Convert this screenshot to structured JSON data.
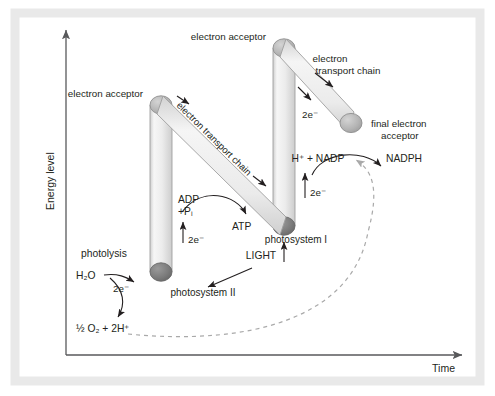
{
  "figure": {
    "axes": {
      "y_label": "Energy level",
      "x_label": "Time"
    },
    "colors": {
      "background": "#ffffff",
      "frame": "#e8e8e8",
      "axis": "#58595b",
      "text": "#231f20",
      "column_fill_light": "#f2f2f2",
      "column_fill_mid": "#dcdcdc",
      "acceptor_circle": "#b3b3b3",
      "photosystem_circle": "#7a7a7a",
      "final_acceptor_circle": "#a6a6a6",
      "dashed_curve": "#a9a9a9"
    },
    "labels": {
      "electron_acceptor_ps2": "electron acceptor",
      "electron_acceptor_ps1": "electron acceptor",
      "etc_1": "electron transport chain",
      "etc_2_line1": "electron",
      "etc_2_line2": "transport chain",
      "final_acceptor_line1": "final electron",
      "final_acceptor_line2": "acceptor",
      "photosystem_2": "photosystem II",
      "photosystem_1": "photosystem I",
      "photolysis": "photolysis",
      "water": "H₂O",
      "oxygen_products": "½ O₂ + 2H⁺",
      "adp_line1": "ADP",
      "adp_line2": "+Pᵢ",
      "atp": "ATP",
      "light": "LIGHT",
      "nadp": "H⁺ + NADP",
      "nadph": "NADPH",
      "electrons_a": "2e⁻",
      "electrons_b": "2e⁻",
      "electrons_c": "2e⁻",
      "electrons_d": "2e⁻",
      "electrons_e": "2e⁻"
    }
  }
}
